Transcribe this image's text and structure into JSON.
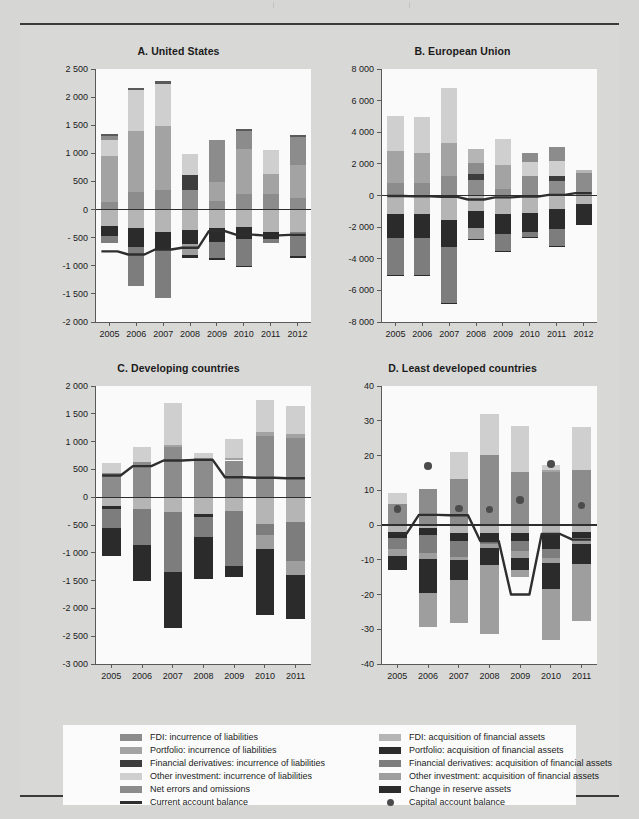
{
  "legend": {
    "left_items": [
      {
        "label": "FDI: incurrence of liabilities",
        "color": "#8c8c8c",
        "kind": "swatch"
      },
      {
        "label": "Portfolio: incurrence of liabilities",
        "color": "#a3a3a3",
        "kind": "swatch"
      },
      {
        "label": "Financial derivatives: incurrence of liabilities",
        "color": "#3d3d3d",
        "kind": "swatch"
      },
      {
        "label": "Other investment: incurrence of liabilities",
        "color": "#cfcfcf",
        "kind": "swatch"
      },
      {
        "label": "Net errors and omissions",
        "color": "#8c8c8c",
        "kind": "swatch"
      },
      {
        "label": "Current account balance",
        "color": "#2e2e2e",
        "kind": "line"
      }
    ],
    "right_items": [
      {
        "label": "FDI: acquisition of financial assets",
        "color": "#b5b5b5",
        "kind": "swatch"
      },
      {
        "label": "Portfolio: acquisition of financial assets",
        "color": "#2b2b2b",
        "kind": "swatch"
      },
      {
        "label": "Financial derivatives: acquisition of financial assets",
        "color": "#7d7d7d",
        "kind": "swatch"
      },
      {
        "label": "Other investment: acquisition of financial assets",
        "color": "#9e9e9e",
        "kind": "swatch"
      },
      {
        "label": "Change in reserve assets",
        "color": "#2b2b2b",
        "kind": "swatch"
      },
      {
        "label": "Capital account balance",
        "color": "#4b4b4b",
        "kind": "dot"
      }
    ]
  },
  "chart_data": [
    {
      "panel": "A",
      "type": "bar",
      "title": "A. United States",
      "categories": [
        "2005",
        "2006",
        "2007",
        "2008",
        "2009",
        "2010",
        "2011",
        "2012"
      ],
      "xlabel": "",
      "ylabel": "",
      "ylim": [
        -2000,
        2500
      ],
      "yticks": [
        -2000,
        -1500,
        -1000,
        -500,
        0,
        500,
        1000,
        1500,
        2000,
        2500
      ],
      "ytick_labels": [
        "-2 000",
        "-1 500",
        "-1 000",
        "- 500",
        "0",
        "500",
        "1 000",
        "1 500",
        "2 000",
        "2 500"
      ],
      "grid": false,
      "stacked": true,
      "series": [
        {
          "name": "FDI: incurrence of liabilities",
          "color": "#8c8c8c",
          "values": [
            130,
            310,
            340,
            340,
            160,
            280,
            270,
            210
          ]
        },
        {
          "name": "Portfolio: incurrence of liabilities",
          "color": "#a3a3a3",
          "values": [
            825,
            1095,
            1150,
            0,
            330,
            790,
            355,
            575
          ]
        },
        {
          "name": "Financial derivatives: incurrence of liabilities",
          "color": "#3d3d3d",
          "values": [
            0,
            0,
            0,
            275,
            0,
            0,
            0,
            0
          ]
        },
        {
          "name": "Other investment: incurrence of liabilities",
          "color": "#cfcfcf",
          "values": [
            290,
            720,
            750,
            375,
            0,
            0,
            440,
            0
          ]
        },
        {
          "name": "Net errors and omissions",
          "color": "#8c8c8c",
          "values": [
            60,
            0,
            0,
            0,
            740,
            330,
            0,
            510
          ]
        },
        {
          "name": "Capital / top cap",
          "color": "#5a5a5a",
          "values": [
            30,
            30,
            45,
            0,
            0,
            40,
            0,
            30
          ]
        },
        {
          "name": "FDI: acquisition of financial assets",
          "color": "#b5b5b5",
          "values": [
            -285,
            -320,
            -395,
            -370,
            -320,
            -305,
            -400,
            -400
          ]
        },
        {
          "name": "Portfolio: acquisition of financial assets",
          "color": "#2b2b2b",
          "values": [
            -180,
            -340,
            -320,
            -250,
            -250,
            -210,
            -120,
            0
          ]
        },
        {
          "name": "Financial derivatives: acquisition",
          "color": "#7d7d7d",
          "values": [
            -125,
            -700,
            -855,
            0,
            -290,
            -490,
            -75,
            -430
          ]
        },
        {
          "name": "Other investment: acquisition",
          "color": "#9e9e9e",
          "values": [
            0,
            0,
            0,
            -180,
            0,
            0,
            0,
            0
          ]
        },
        {
          "name": "Change in reserve assets",
          "color": "#2b2b2b",
          "values": [
            0,
            0,
            0,
            -55,
            -30,
            -20,
            0,
            -30
          ]
        }
      ],
      "line": {
        "name": "Current account balance",
        "color": "#2e2e2e",
        "values": [
          -745,
          -800,
          -710,
          -680,
          -385,
          -445,
          -460,
          -450
        ]
      }
    },
    {
      "panel": "B",
      "type": "bar",
      "title": "B. European Union",
      "categories": [
        "2005",
        "2006",
        "2007",
        "2008",
        "2009",
        "2010",
        "2011",
        "2012"
      ],
      "xlabel": "",
      "ylabel": "",
      "ylim": [
        -8000,
        8000
      ],
      "yticks": [
        -8000,
        -6000,
        -4000,
        -2000,
        0,
        2000,
        4000,
        6000,
        8000
      ],
      "ytick_labels": [
        "-8 000",
        "-6 000",
        "-4 000",
        "-2 000",
        "0",
        "2 000",
        "4 000",
        "6 000",
        "8 000"
      ],
      "grid": false,
      "stacked": true,
      "series": [
        {
          "name": "FDI: incurrence of liabilities",
          "color": "#8c8c8c",
          "values": [
            790,
            780,
            1210,
            1000,
            420,
            1250,
            910,
            700
          ]
        },
        {
          "name": "Portfolio: incurrence of liabilities",
          "color": "#a3a3a3",
          "values": [
            2020,
            1930,
            2080,
            0,
            1520,
            0,
            0,
            0
          ]
        },
        {
          "name": "Financial derivatives: incurrence",
          "color": "#3d3d3d",
          "values": [
            0,
            0,
            0,
            360,
            0,
            0,
            300,
            0
          ]
        },
        {
          "name": "Other investment: incurrence",
          "color": "#cfcfcf",
          "values": [
            2210,
            2240,
            3530,
            0,
            1610,
            880,
            960,
            0
          ]
        },
        {
          "name": "Net errors and omissions",
          "color": "#8c8c8c",
          "values": [
            0,
            0,
            0,
            680,
            0,
            560,
            920,
            750
          ]
        },
        {
          "name": "Extra cap",
          "color": "#b5b5b5",
          "values": [
            0,
            0,
            0,
            870,
            0,
            0,
            0,
            150
          ]
        },
        {
          "name": "FDI: acquisition of financial assets",
          "color": "#b5b5b5",
          "values": [
            -1180,
            -1170,
            -1560,
            -950,
            -1150,
            -1120,
            -870,
            -560
          ]
        },
        {
          "name": "Portfolio: acquisition",
          "color": "#2b2b2b",
          "values": [
            -1530,
            -1500,
            -1670,
            -1080,
            -1270,
            -1180,
            -1230,
            -1220
          ]
        },
        {
          "name": "Financial derivatives: acquisition",
          "color": "#7d7d7d",
          "values": [
            -2320,
            -2340,
            -3580,
            0,
            -1100,
            -310,
            -1100,
            0
          ]
        },
        {
          "name": "Other investment: acquisition",
          "color": "#9e9e9e",
          "values": [
            0,
            0,
            0,
            -690,
            0,
            0,
            0,
            0
          ]
        },
        {
          "name": "Change in reserve assets",
          "color": "#2b2b2b",
          "values": [
            -30,
            -30,
            -40,
            -30,
            -60,
            -40,
            -20,
            -30
          ]
        }
      ],
      "line": {
        "name": "Current account balance",
        "color": "#2e2e2e",
        "values": [
          -30,
          -60,
          -90,
          -250,
          -120,
          -70,
          40,
          150
        ]
      }
    },
    {
      "panel": "C",
      "type": "bar",
      "title": "C. Developing countries",
      "categories": [
        "2005",
        "2006",
        "2007",
        "2008",
        "2009",
        "2010",
        "2011"
      ],
      "xlabel": "",
      "ylabel": "",
      "ylim": [
        -3000,
        2000
      ],
      "yticks": [
        -3000,
        -2500,
        -2000,
        -1500,
        -1000,
        -500,
        0,
        500,
        1000,
        1500,
        2000
      ],
      "ytick_labels": [
        "-3 000",
        "-2 500",
        "-2 000",
        "-1 500",
        "-1 000",
        "- 500",
        "0",
        "500",
        "1 000",
        "1 500",
        "2 000"
      ],
      "grid": false,
      "stacked": true,
      "series": [
        {
          "name": "FDI: incurrence of liabilities",
          "color": "#8c8c8c",
          "values": [
            440,
            640,
            900,
            700,
            660,
            1100,
            1060
          ]
        },
        {
          "name": "Portfolio: incurrence of liabilities",
          "color": "#a3a3a3",
          "values": [
            0,
            0,
            40,
            0,
            40,
            70,
            80
          ]
        },
        {
          "name": "Financial derivatives: incurrence",
          "color": "#3d3d3d",
          "values": [
            0,
            0,
            0,
            0,
            0,
            0,
            0
          ]
        },
        {
          "name": "Other investment: incurrence",
          "color": "#cfcfcf",
          "values": [
            180,
            270,
            760,
            90,
            340,
            570,
            500
          ]
        },
        {
          "name": "Net errors and omissions",
          "color": "#8c8c8c",
          "values": [
            0,
            0,
            0,
            0,
            0,
            0,
            0
          ]
        },
        {
          "name": "FDI: acquisition of financial assets",
          "color": "#b5b5b5",
          "values": [
            -160,
            -210,
            -260,
            -300,
            -250,
            -480,
            -440
          ]
        },
        {
          "name": "Portfolio: acquisition",
          "color": "#2b2b2b",
          "values": [
            -60,
            0,
            0,
            -60,
            0,
            0,
            0
          ]
        },
        {
          "name": "Financial derivatives: acquisition",
          "color": "#7d7d7d",
          "values": [
            -340,
            -650,
            -1090,
            -350,
            -990,
            -200,
            -710
          ]
        },
        {
          "name": "Other investment: acquisition",
          "color": "#9e9e9e",
          "values": [
            0,
            0,
            0,
            0,
            0,
            -250,
            -250
          ]
        },
        {
          "name": "Change in reserve assets",
          "color": "#2b2b2b",
          "values": [
            -490,
            -640,
            -1000,
            -760,
            -190,
            -1180,
            -790
          ]
        }
      ],
      "line": {
        "name": "Current account balance",
        "color": "#2e2e2e",
        "values": [
          390,
          560,
          660,
          670,
          360,
          350,
          340
        ]
      }
    },
    {
      "panel": "D",
      "type": "bar",
      "title": "D. Least developed countries",
      "categories": [
        "2005",
        "2006",
        "2007",
        "2008",
        "2009",
        "2010",
        "2011"
      ],
      "xlabel": "",
      "ylabel": "",
      "ylim": [
        -40,
        40
      ],
      "yticks": [
        -40,
        -30,
        -20,
        -10,
        0,
        10,
        20,
        30,
        40
      ],
      "ytick_labels": [
        "-40",
        "-30",
        "-20",
        "-10",
        "0",
        "10",
        "20",
        "30",
        "40"
      ],
      "grid": false,
      "stacked": true,
      "series": [
        {
          "name": "FDI: incurrence of liabilities",
          "color": "#8c8c8c",
          "values": [
            6.0,
            10.3,
            13.2,
            20.2,
            15.3,
            15.2,
            15.8
          ]
        },
        {
          "name": "Portfolio: incurrence of liabilities",
          "color": "#a3a3a3",
          "values": [
            0.0,
            0.0,
            0.0,
            0.0,
            0.0,
            0.6,
            0.0
          ]
        },
        {
          "name": "Other investment: incurrence",
          "color": "#cfcfcf",
          "values": [
            3.3,
            0.0,
            7.8,
            11.6,
            13.2,
            1.6,
            12.4
          ]
        },
        {
          "name": "FDI: acquisition of financial assets",
          "color": "#b5b5b5",
          "values": [
            -2.0,
            -1.0,
            -2.2,
            -2.2,
            -2.2,
            -2.3,
            -2.0
          ]
        },
        {
          "name": "Portfolio: acquisition",
          "color": "#2b2b2b",
          "values": [
            -1.8,
            -2.0,
            -2.5,
            -2.4,
            -2.4,
            -4.7,
            -1.8
          ]
        },
        {
          "name": "Financial derivatives: acquisition",
          "color": "#7d7d7d",
          "values": [
            -3.2,
            -5.2,
            -4.5,
            -1.0,
            -3.0,
            -2.5,
            0.0
          ]
        },
        {
          "name": "Other investment: acquisition",
          "color": "#9e9e9e",
          "values": [
            -2.0,
            -1.5,
            -1.0,
            -1.0,
            -2.0,
            -1.5,
            -1.8
          ]
        },
        {
          "name": "Change in reserve assets",
          "color": "#2b2b2b",
          "values": [
            -4.0,
            -9.8,
            -5.5,
            -5.0,
            -3.4,
            -7.5,
            -5.5
          ]
        },
        {
          "name": "Other investment (lower)",
          "color": "#9e9e9e",
          "values": [
            0.0,
            -9.8,
            -12.5,
            -19.9,
            -2.0,
            -14.5,
            -16.4
          ]
        }
      ],
      "line": {
        "name": "Current account balance",
        "color": "#2e2e2e",
        "values": [
          -2.5,
          2.9,
          2.8,
          -4.6,
          -20.0,
          -2.6,
          -4.2
        ]
      },
      "dots": {
        "name": "Capital account balance",
        "color": "#4b4b4b",
        "values": [
          4.6,
          17.0,
          4.8,
          4.5,
          7.2,
          17.5,
          5.6
        ]
      }
    }
  ]
}
